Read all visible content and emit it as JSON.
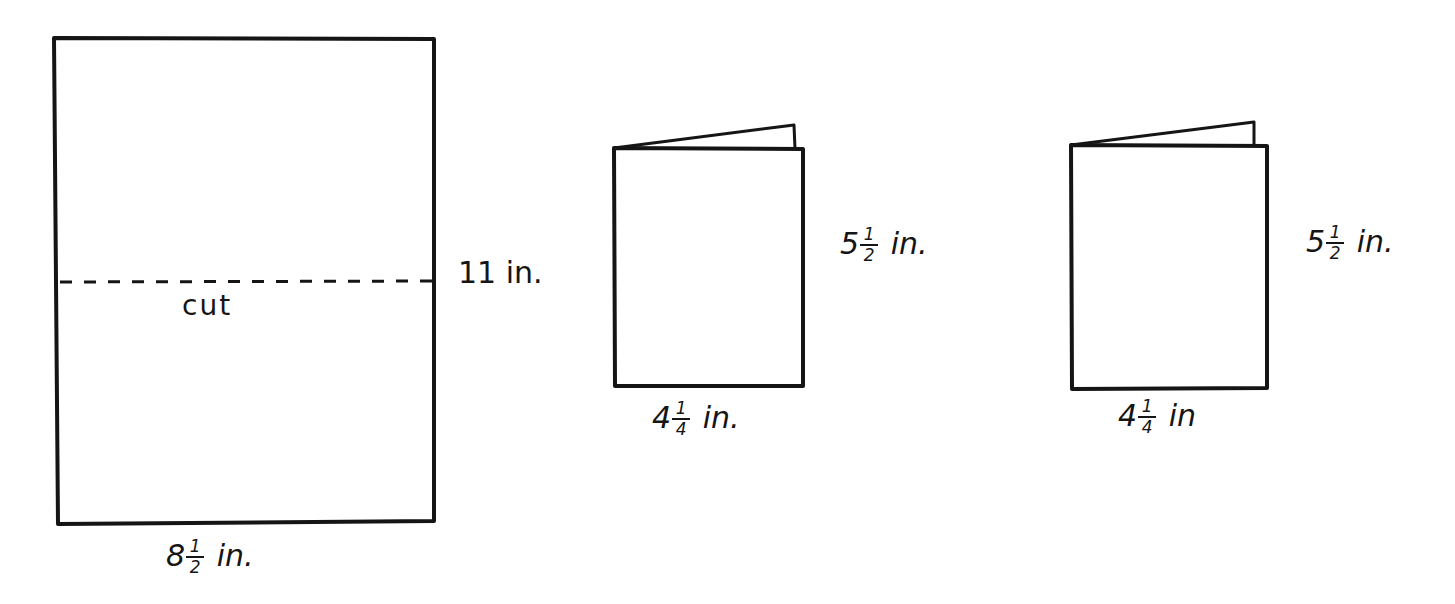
{
  "diagram": {
    "title": "",
    "colors": {
      "ink": "#151515",
      "paper": "#ffffff"
    },
    "full_sheet": {
      "width_label": {
        "whole": "8",
        "num": "1",
        "den": "2",
        "unit": "in."
      },
      "height_label": {
        "text": "11 in."
      },
      "cut_line_label": "cut"
    },
    "booklet_1": {
      "height_label": {
        "whole": "5",
        "num": "1",
        "den": "2",
        "unit": "in."
      },
      "width_label": {
        "whole": "4",
        "num": "1",
        "den": "4",
        "unit": "in."
      }
    },
    "booklet_2": {
      "height_label": {
        "whole": "5",
        "num": "1",
        "den": "2",
        "unit": "in."
      },
      "width_label": {
        "whole": "4",
        "num": "1",
        "den": "4",
        "unit": "in"
      }
    }
  }
}
